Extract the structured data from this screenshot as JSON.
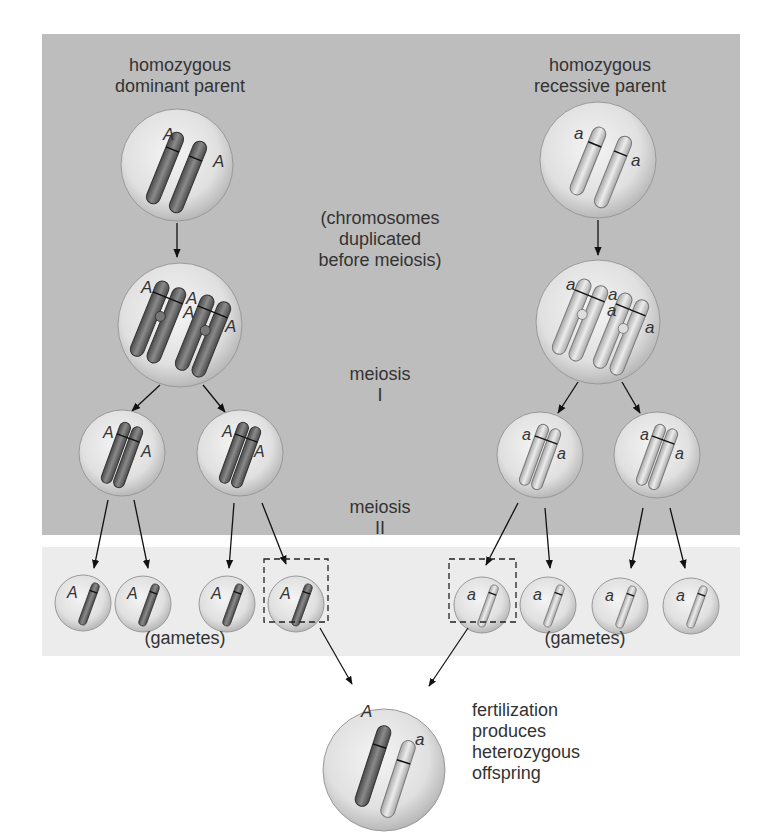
{
  "labels": {
    "dominant_parent": "homozygous\ndominant parent",
    "recessive_parent": "homozygous\nrecessive parent",
    "duplication": "(chromosomes\nduplicated\nbefore meiosis)",
    "meiosis_1": "meiosis\nI",
    "meiosis_2": "meiosis\nII",
    "gametes_left": "(gametes)",
    "gametes_right": "(gametes)",
    "fertilization": "fertilization\nproduces\nheterozygous\noffspring"
  },
  "alleles": {
    "dominant": "A",
    "recessive": "a"
  },
  "colors": {
    "top_panel": "#bdbdbd",
    "gamete_panel": "#ececec",
    "dominant_chromosome": "#6e6e6e",
    "recessive_chromosome": "#d6d6d6",
    "cell_fill": "#e4e4e4",
    "text": "#333333"
  },
  "stages": [
    {
      "stage": "parents",
      "cells": [
        {
          "side": "left",
          "genotype": "AA"
        },
        {
          "side": "right",
          "genotype": "aa"
        }
      ]
    },
    {
      "stage": "duplicated",
      "cells": [
        {
          "side": "left",
          "genotype": "AAAA"
        },
        {
          "side": "right",
          "genotype": "aaaa"
        }
      ]
    },
    {
      "stage": "meiosis_I_products",
      "cells": [
        {
          "genotype": "AA"
        },
        {
          "genotype": "AA"
        },
        {
          "genotype": "aa"
        },
        {
          "genotype": "aa"
        }
      ]
    },
    {
      "stage": "gametes",
      "cells": [
        {
          "allele": "A"
        },
        {
          "allele": "A"
        },
        {
          "allele": "A"
        },
        {
          "allele": "A",
          "selected": true
        },
        {
          "allele": "a",
          "selected": true
        },
        {
          "allele": "a"
        },
        {
          "allele": "a"
        },
        {
          "allele": "a"
        }
      ]
    },
    {
      "stage": "offspring",
      "cells": [
        {
          "genotype": "Aa"
        }
      ]
    }
  ]
}
